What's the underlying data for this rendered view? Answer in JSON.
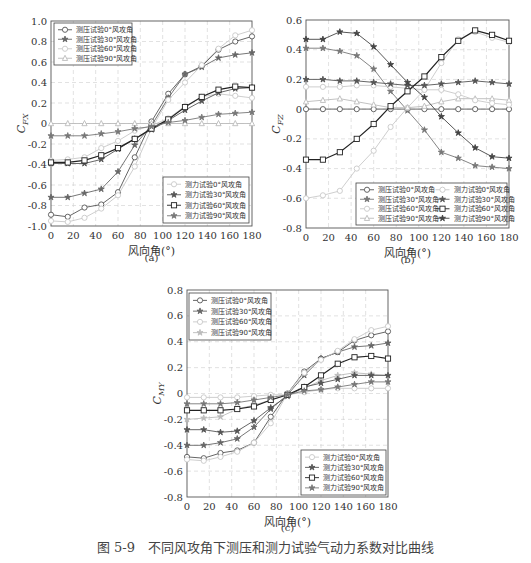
{
  "figure_caption": "图 5-9　不同风攻角下测压和测力试验气动力系数对比曲线",
  "chart_data": [
    {
      "id": "a",
      "type": "line",
      "panel_label": "(a)",
      "title": "",
      "xlabel": "风向角(°)",
      "ylabel": "C_FX",
      "xlim": [
        0,
        180
      ],
      "ylim": [
        -1.0,
        1.0
      ],
      "xticks": [
        0,
        20,
        40,
        60,
        80,
        100,
        120,
        140,
        160,
        180
      ],
      "yticks": [
        -1.0,
        -0.8,
        -0.6,
        -0.4,
        -0.2,
        0,
        0.2,
        0.4,
        0.6,
        0.8,
        1.0
      ],
      "ytick_labels": [
        "-1.0",
        "-0.8",
        "-0.6",
        "-0.4",
        "-0.2",
        "0",
        "0.2",
        "0.4",
        "0.6",
        "0.8",
        "1.0"
      ],
      "grid": true,
      "x": [
        0,
        15,
        30,
        45,
        60,
        75,
        90,
        105,
        120,
        135,
        150,
        165,
        180
      ],
      "legends": [
        {
          "position": "upper-left",
          "entries": [
            "测压试验0°风攻角",
            "测压试验30°风攻角",
            "测压试验60°风攻角",
            "测压试验90°风攻角"
          ]
        },
        {
          "position": "lower-right",
          "entries": [
            "测力试验0°风攻角",
            "测力试验30°风攻角",
            "测力试验60°风攻角",
            "测力试验90°风攻角"
          ]
        }
      ],
      "series": [
        {
          "name": "测压试验0°风攻角",
          "marker": "circle",
          "color": "#555555",
          "values": [
            -0.89,
            -0.91,
            -0.82,
            -0.79,
            -0.67,
            -0.33,
            0.02,
            0.29,
            0.48,
            0.56,
            0.72,
            0.8,
            0.85
          ]
        },
        {
          "name": "测压试验30°风攻角",
          "marker": "star",
          "color": "#666666",
          "values": [
            -0.72,
            -0.72,
            -0.68,
            -0.64,
            -0.47,
            -0.21,
            -0.02,
            0.25,
            0.48,
            0.55,
            0.64,
            0.67,
            0.69
          ]
        },
        {
          "name": "测压试验60°风攻角",
          "marker": "circle",
          "color": "#c8c8c8",
          "values": [
            -0.36,
            -0.35,
            -0.33,
            -0.24,
            -0.17,
            -0.07,
            -0.02,
            0.05,
            0.17,
            0.26,
            0.29,
            0.27,
            0.25
          ]
        },
        {
          "name": "测压试验90°风攻角",
          "marker": "triangle",
          "color": "#bbbbbb",
          "values": [
            0.0,
            0.0,
            0.0,
            0.0,
            0.0,
            0.0,
            0.0,
            0.0,
            0.0,
            0.0,
            0.0,
            0.0,
            0.0
          ]
        },
        {
          "name": "测力试验0°风攻角",
          "marker": "circle",
          "color": "#c8c8c8",
          "values": [
            -0.95,
            -0.96,
            -0.92,
            -0.83,
            -0.7,
            -0.42,
            -0.05,
            0.23,
            0.4,
            0.57,
            0.73,
            0.86,
            0.91
          ]
        },
        {
          "name": "测力试验30°风攻角",
          "marker": "star",
          "color": "#555555",
          "values": [
            -0.39,
            -0.39,
            -0.39,
            -0.35,
            -0.25,
            -0.15,
            -0.06,
            0.03,
            0.13,
            0.22,
            0.3,
            0.34,
            0.35
          ]
        },
        {
          "name": "测力试验60°风攻角",
          "marker": "square",
          "color": "#222222",
          "values": [
            -0.38,
            -0.38,
            -0.36,
            -0.31,
            -0.24,
            -0.15,
            -0.05,
            0.04,
            0.16,
            0.26,
            0.33,
            0.36,
            0.35
          ]
        },
        {
          "name": "测力试验90°风攻角",
          "marker": "star",
          "color": "#777777",
          "values": [
            -0.12,
            -0.12,
            -0.12,
            -0.1,
            -0.08,
            -0.05,
            -0.03,
            0.01,
            0.03,
            0.06,
            0.09,
            0.1,
            0.11
          ]
        }
      ]
    },
    {
      "id": "b",
      "type": "line",
      "panel_label": "(b)",
      "title": "",
      "xlabel": "风向角(°)",
      "ylabel": "C_FZ",
      "xlim": [
        0,
        180
      ],
      "ylim": [
        -0.8,
        0.6
      ],
      "xticks": [
        0,
        20,
        40,
        60,
        80,
        100,
        120,
        140,
        160,
        180
      ],
      "yticks": [
        -0.8,
        -0.6,
        -0.4,
        -0.2,
        0,
        0.2,
        0.4,
        0.6
      ],
      "ytick_labels": [
        "-0.8",
        "-0.6",
        "-0.4",
        "-0.2",
        "0",
        "0.2",
        "0.4",
        "0.6"
      ],
      "grid": true,
      "x": [
        0,
        15,
        30,
        45,
        60,
        75,
        90,
        105,
        120,
        135,
        150,
        165,
        180
      ],
      "legends": [
        {
          "position": "lower-right",
          "columns": 2,
          "entries": [
            "测压试验0°风攻角",
            "测力试验0°风攻角",
            "测压试验30°风攻角",
            "测力试验30°风攻角",
            "测压试验60°风攻角",
            "测力试验60°风攻角",
            "测压试验90°风攻角",
            "测力试验90°风攻角"
          ]
        }
      ],
      "series": [
        {
          "name": "测压试验0°风攻角",
          "marker": "circle",
          "color": "#555555",
          "values": [
            0.0,
            0.0,
            0.0,
            0.0,
            0.0,
            0.0,
            0.0,
            0.0,
            0.0,
            0.0,
            0.0,
            0.0,
            0.0
          ]
        },
        {
          "name": "测压试验30°风攻角",
          "marker": "star",
          "color": "#777777",
          "values": [
            0.41,
            0.41,
            0.39,
            0.36,
            0.27,
            0.12,
            -0.01,
            -0.14,
            -0.29,
            -0.33,
            -0.38,
            -0.39,
            -0.4
          ]
        },
        {
          "name": "测压试验60°风攻角",
          "marker": "circle",
          "color": "#c8c8c8",
          "values": [
            -0.6,
            -0.58,
            -0.55,
            -0.4,
            -0.28,
            -0.12,
            0.01,
            0.13,
            0.31,
            0.47,
            0.52,
            0.48,
            0.45
          ]
        },
        {
          "name": "测压试验90°风攻角",
          "marker": "triangle",
          "color": "#bbbbbb",
          "values": [
            0.05,
            0.06,
            0.07,
            0.05,
            0.03,
            0.01,
            0.01,
            0.02,
            0.05,
            0.07,
            0.07,
            0.07,
            0.06
          ]
        },
        {
          "name": "测力试验0°风攻角",
          "marker": "circle",
          "color": "#c8c8c8",
          "values": [
            0.15,
            0.15,
            0.15,
            0.16,
            0.16,
            0.15,
            0.14,
            0.13,
            0.13,
            0.1,
            0.06,
            0.04,
            0.03
          ]
        },
        {
          "name": "测力试验30°风攻角",
          "marker": "star",
          "color": "#555555",
          "values": [
            0.2,
            0.2,
            0.19,
            0.19,
            0.18,
            0.17,
            0.16,
            0.16,
            0.17,
            0.18,
            0.19,
            0.18,
            0.17
          ]
        },
        {
          "name": "测力试验60°风攻角",
          "marker": "square",
          "color": "#222222",
          "values": [
            -0.34,
            -0.34,
            -0.29,
            -0.2,
            -0.1,
            0.02,
            0.12,
            0.22,
            0.35,
            0.46,
            0.53,
            0.5,
            0.46
          ]
        },
        {
          "name": "测力试验90°风攻角",
          "marker": "star",
          "color": "#444444",
          "values": [
            0.47,
            0.47,
            0.52,
            0.51,
            0.42,
            0.3,
            0.18,
            0.08,
            -0.05,
            -0.16,
            -0.26,
            -0.32,
            -0.33
          ]
        }
      ]
    },
    {
      "id": "c",
      "type": "line",
      "panel_label": "(c)",
      "title": "",
      "xlabel": "风向角(°)",
      "ylabel": "C_MY",
      "xlim": [
        0,
        180
      ],
      "ylim": [
        -0.8,
        0.8
      ],
      "xticks": [
        0,
        20,
        40,
        60,
        80,
        100,
        120,
        140,
        160,
        180
      ],
      "yticks": [
        -0.8,
        -0.6,
        -0.4,
        -0.2,
        0,
        0.2,
        0.4,
        0.6,
        0.8
      ],
      "ytick_labels": [
        "-0.8",
        "-0.6",
        "-0.4",
        "-0.2",
        "0",
        "0.2",
        "0.4",
        "0.6",
        "0.8"
      ],
      "grid": true,
      "x": [
        0,
        15,
        30,
        45,
        60,
        75,
        90,
        105,
        120,
        135,
        150,
        165,
        180
      ],
      "legends": [
        {
          "position": "upper-left",
          "entries": [
            "测压试验0°风攻角",
            "测压试验30°风攻角",
            "测压试验60°风攻角",
            "测压试验90°风攻角"
          ]
        },
        {
          "position": "lower-right",
          "entries": [
            "测力试验0°风攻角",
            "测力试验30°风攻角",
            "测力试验60°风攻角",
            "测力试验90°风攻角"
          ]
        }
      ],
      "series": [
        {
          "name": "测压试验0°风攻角",
          "marker": "circle",
          "color": "#555555",
          "values": [
            -0.49,
            -0.5,
            -0.46,
            -0.44,
            -0.38,
            -0.18,
            0.0,
            0.17,
            0.27,
            0.32,
            0.41,
            0.45,
            0.48
          ]
        },
        {
          "name": "测压试验30°风攻角",
          "marker": "star",
          "color": "#666666",
          "values": [
            -0.4,
            -0.4,
            -0.38,
            -0.35,
            -0.26,
            -0.12,
            -0.01,
            0.14,
            0.27,
            0.32,
            0.36,
            0.37,
            0.39
          ]
        },
        {
          "name": "测压试验60°风攻角",
          "marker": "circle",
          "color": "#c8c8c8",
          "values": [
            -0.51,
            -0.52,
            -0.49,
            -0.45,
            -0.38,
            -0.23,
            0.0,
            0.16,
            0.26,
            0.33,
            0.42,
            0.49,
            0.52
          ]
        },
        {
          "name": "测压试验90°风攻角",
          "marker": "star",
          "color": "#bbbbbb",
          "values": [
            -0.2,
            -0.19,
            -0.18,
            -0.12,
            -0.09,
            -0.05,
            -0.01,
            0.04,
            0.1,
            0.14,
            0.16,
            0.15,
            0.14
          ]
        },
        {
          "name": "测力试验0°风攻角",
          "marker": "circle",
          "color": "#c8c8c8",
          "values": [
            -0.03,
            -0.03,
            -0.03,
            -0.03,
            -0.02,
            -0.01,
            -0.01,
            0.01,
            0.03,
            0.04,
            0.04,
            0.04,
            0.04
          ]
        },
        {
          "name": "测力试验30°风攻角",
          "marker": "star",
          "color": "#555555",
          "values": [
            -0.28,
            -0.28,
            -0.3,
            -0.29,
            -0.21,
            -0.11,
            -0.02,
            0.05,
            0.08,
            0.11,
            0.14,
            0.14,
            0.14
          ]
        },
        {
          "name": "测力试验60°风攻角",
          "marker": "square",
          "color": "#222222",
          "values": [
            -0.13,
            -0.13,
            -0.13,
            -0.12,
            -0.1,
            -0.05,
            -0.01,
            0.05,
            0.14,
            0.23,
            0.28,
            0.29,
            0.27
          ]
        },
        {
          "name": "测力试验90°风攻角",
          "marker": "star",
          "color": "#777777",
          "values": [
            -0.08,
            -0.08,
            -0.08,
            -0.07,
            -0.05,
            -0.03,
            -0.01,
            0.02,
            0.03,
            0.05,
            0.07,
            0.09,
            0.09
          ]
        }
      ]
    }
  ],
  "layout": {
    "panels": [
      {
        "left": 51,
        "top": 21,
        "width": 201,
        "height": 205,
        "legend_boxes": [
          {
            "x": 54,
            "y": 23,
            "w": 78,
            "h": 42
          },
          {
            "x": 163,
            "y": 177,
            "w": 86,
            "h": 46
          }
        ],
        "label_y": 261
      },
      {
        "left": 306,
        "top": 20,
        "width": 203,
        "height": 208,
        "legend_boxes": [
          {
            "x": 356,
            "y": 183,
            "w": 151,
            "h": 42
          }
        ],
        "label_y": 263
      },
      {
        "left": 187,
        "top": 290,
        "width": 201,
        "height": 207,
        "legend_boxes": [
          {
            "x": 189,
            "y": 293,
            "w": 82,
            "h": 47
          },
          {
            "x": 301,
            "y": 450,
            "w": 85,
            "h": 45
          }
        ],
        "label_y": 531
      }
    ]
  }
}
